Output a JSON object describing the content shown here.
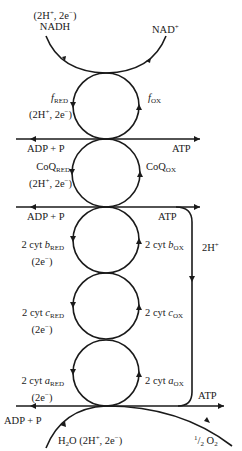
{
  "diagram": {
    "type": "electron-transport-chain-cycles",
    "top": {
      "nadh_sub": "(2H+, 2e−)",
      "nadh": "NADH",
      "nad_plus": "NAD+"
    },
    "cycles": [
      {
        "red": "f",
        "red_sub": "RED",
        "red_note": "(2H+, 2e−)",
        "ox": "f",
        "ox_sub": "OX"
      },
      {
        "red": "CoQ",
        "red_sub": "RED",
        "red_note": "(2H+, 2e−)",
        "ox": "CoQ",
        "ox_sub": "OX"
      },
      {
        "red": "2 cyt b",
        "red_sub": "RED",
        "red_note": "(2e−)",
        "ox": "2 cyt b",
        "ox_sub": "OX"
      },
      {
        "red": "2 cyt c",
        "red_sub": "RED",
        "red_note": "(2e−)",
        "ox": "2 cyt c",
        "ox_sub": "OX"
      },
      {
        "red": "2 cyt a",
        "red_sub": "RED",
        "red_note": "(2e−)",
        "ox": "2 cyt a",
        "ox_sub": "OX"
      }
    ],
    "phosphorylation": [
      {
        "input": "ADP + P",
        "output": "ATP"
      },
      {
        "input": "ADP + P",
        "output": "ATP"
      },
      {
        "input": "ADP + P",
        "output": "ATP"
      }
    ],
    "proton_loop": "2H+",
    "bottom": {
      "water": "H2O (2H+, 2e−)",
      "oxygen": "1/2 O2"
    }
  }
}
